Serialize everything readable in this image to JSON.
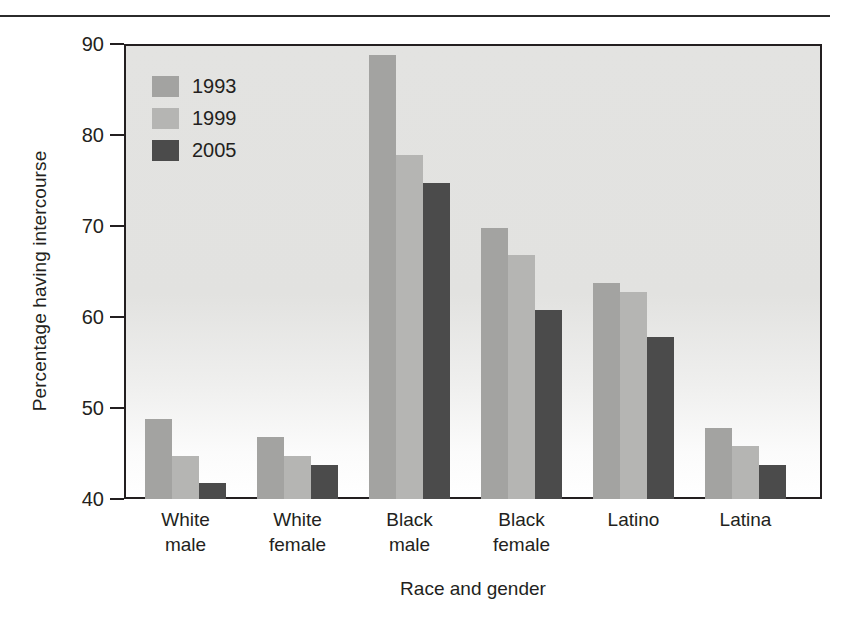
{
  "chart_data": {
    "type": "bar",
    "title": "",
    "xlabel": "Race and gender",
    "ylabel": "Percentage having intercourse",
    "ylim": [
      40,
      90
    ],
    "yticks": [
      40,
      50,
      60,
      70,
      80,
      90
    ],
    "grid": false,
    "legend_position": "top-left",
    "categories": [
      "White male",
      "White female",
      "Black male",
      "Black female",
      "Latino",
      "Latina"
    ],
    "category_lines": [
      [
        "White",
        "male"
      ],
      [
        "White",
        "female"
      ],
      [
        "Black",
        "male"
      ],
      [
        "Black",
        "female"
      ],
      [
        "Latino",
        ""
      ],
      [
        "Latina",
        ""
      ]
    ],
    "series": [
      {
        "name": "1993",
        "color": "#a3a3a1",
        "values": [
          49,
          47,
          89,
          70,
          64,
          48
        ]
      },
      {
        "name": "1999",
        "color": "#b5b5b3",
        "values": [
          45,
          45,
          78,
          67,
          63,
          46
        ]
      },
      {
        "name": "2005",
        "color": "#4b4b4b",
        "values": [
          42,
          44,
          75,
          61,
          58,
          44
        ]
      }
    ]
  },
  "legend": {
    "items": [
      {
        "label": "1993",
        "color": "#a3a3a1"
      },
      {
        "label": "1999",
        "color": "#b5b5b3"
      },
      {
        "label": "2005",
        "color": "#4b4b4b"
      }
    ]
  },
  "axes": {
    "y_title": "Percentage having intercourse",
    "x_title": "Race and gender",
    "y_tick_labels": [
      "90",
      "80",
      "70",
      "60",
      "50",
      "40"
    ]
  },
  "colors": {
    "axis": "#231f20",
    "plot_background": "#e3e3e1",
    "series_1993": "#a3a3a1",
    "series_1999": "#b5b5b3",
    "series_2005": "#4b4b4b"
  }
}
